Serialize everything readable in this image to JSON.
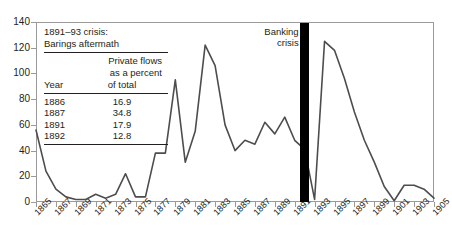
{
  "chart_data": {
    "type": "line",
    "title": "",
    "xlabel": "",
    "ylabel": "",
    "ylim": [
      0,
      140
    ],
    "ytick_values": [
      0,
      20,
      40,
      60,
      80,
      100,
      120,
      140
    ],
    "xlim": [
      1865,
      1905
    ],
    "grid": false,
    "legend": null,
    "xtick_labels": [
      "1865",
      "1867",
      "1869",
      "1871",
      "1873",
      "1875",
      "1877",
      "1879",
      "1881",
      "1883",
      "1885",
      "1887",
      "1889",
      "1891",
      "1893",
      "1895",
      "1897",
      "1899",
      "1901",
      "1903",
      "1905"
    ],
    "x": [
      1865,
      1866,
      1867,
      1868,
      1869,
      1870,
      1871,
      1872,
      1873,
      1874,
      1875,
      1876,
      1877,
      1878,
      1879,
      1880,
      1881,
      1882,
      1883,
      1884,
      1885,
      1886,
      1887,
      1888,
      1889,
      1890,
      1891,
      1892,
      1893,
      1894,
      1895,
      1896,
      1897,
      1898,
      1899,
      1900,
      1901,
      1902,
      1903,
      1904,
      1905
    ],
    "values": [
      56,
      24,
      10,
      4,
      2,
      2,
      6,
      3,
      6,
      22,
      4,
      4,
      38,
      38,
      95,
      31,
      55,
      122,
      106,
      60,
      40,
      48,
      45,
      62,
      53,
      66,
      48,
      41,
      2,
      125,
      118,
      96,
      70,
      48,
      31,
      12,
      1,
      13,
      13,
      10,
      3
    ],
    "series": [
      {
        "name": "Capital flows",
        "values": [
          56,
          24,
          10,
          4,
          2,
          2,
          6,
          3,
          6,
          22,
          4,
          4,
          38,
          38,
          95,
          31,
          55,
          122,
          106,
          60,
          40,
          48,
          45,
          62,
          53,
          66,
          48,
          41,
          2,
          125,
          118,
          96,
          70,
          48,
          31,
          12,
          1,
          13,
          13,
          10,
          3
        ]
      }
    ],
    "annotations": [
      {
        "name": "banking-crisis",
        "label_line1": "Banking",
        "label_line2": "crisis",
        "x": 1892,
        "type": "vertical-bar",
        "color": "#000000"
      }
    ],
    "line_color": "#4d4d4d"
  },
  "inset": {
    "title_line1": "1891–93 crisis:",
    "title_line2": "Barings aftermath",
    "header_line1": "Private flows",
    "header_line2": "as a percent",
    "col_year": "Year",
    "col_value": "of total",
    "rows": [
      {
        "year": "1886",
        "value": "16.9"
      },
      {
        "year": "1887",
        "value": "34.8"
      },
      {
        "year": "1891",
        "value": "17.9"
      },
      {
        "year": "1892",
        "value": "12.8"
      }
    ]
  },
  "annotation": {
    "banking_line1": "Banking",
    "banking_line2": "crisis"
  }
}
